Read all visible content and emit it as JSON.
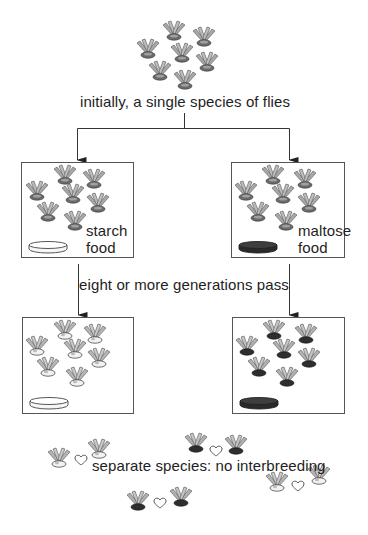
{
  "diagram": {
    "colors": {
      "line": "#333333",
      "box_border": "#555555",
      "fly_wing": "#9a9a9a",
      "fly_body_light": "#e8e8e8",
      "fly_body_dark": "#333333",
      "starch_dish": "#ffffff",
      "maltose_dish": "#3a3a3a",
      "heart": "#444444"
    },
    "labels": {
      "initial": "initially, a single species of flies",
      "generations": "eight or more generations pass",
      "result": "separate species: no interbreeding",
      "starch_line1": "starch",
      "starch_line2": "food",
      "maltose_line1": "maltose",
      "maltose_line2": "food"
    },
    "nodes": [
      {
        "id": "initial-population",
        "flies": 7,
        "fly_body": "mixed"
      },
      {
        "id": "starch-start",
        "food": "starch",
        "flies": 7,
        "fly_body": "mixed"
      },
      {
        "id": "maltose-start",
        "food": "maltose",
        "flies": 7,
        "fly_body": "mixed"
      },
      {
        "id": "starch-end",
        "food": "starch",
        "flies": 7,
        "fly_body": "light"
      },
      {
        "id": "maltose-end",
        "food": "maltose",
        "flies": 7,
        "fly_body": "dark"
      }
    ],
    "pairs": [
      {
        "left": "light",
        "right": "light",
        "symbol": "heart"
      },
      {
        "left": "dark",
        "right": "dark",
        "symbol": "heart"
      },
      {
        "left": "light",
        "right": "light",
        "symbol": "heart"
      },
      {
        "left": "dark",
        "right": "dark",
        "symbol": "heart"
      }
    ],
    "icons": [
      "fly-icon",
      "heart-icon",
      "food-dish-icon",
      "arrow-down-icon"
    ]
  }
}
